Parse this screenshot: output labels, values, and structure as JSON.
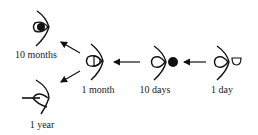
{
  "diagram": {
    "stages": [
      {
        "id": "1-day",
        "label": "1 day"
      },
      {
        "id": "10-days",
        "label": "10 days"
      },
      {
        "id": "1-month",
        "label": "1 month"
      },
      {
        "id": "10-months",
        "label": "10 months"
      },
      {
        "id": "1-year",
        "label": "1 year"
      }
    ],
    "edges": [
      {
        "from": "1 day",
        "to": "10 days"
      },
      {
        "from": "10 days",
        "to": "1 month"
      },
      {
        "from": "1 month",
        "to": "10 months"
      },
      {
        "from": "1 month",
        "to": "1 year"
      }
    ],
    "colors": {
      "ink": "#111111",
      "background": "#ffffff"
    }
  }
}
